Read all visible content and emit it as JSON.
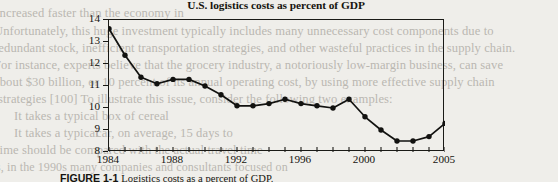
{
  "figure": {
    "caption_label": "FIGURE 1-1",
    "caption_text": "Logistics costs as a percent of GDP."
  },
  "chart_data": {
    "type": "line",
    "title": "U.S. logistics costs as percent of GDP",
    "xlabel": "",
    "ylabel": "",
    "xlim": [
      1984,
      2005
    ],
    "ylim": [
      8,
      14
    ],
    "yticks": [
      8,
      9,
      10,
      11,
      12,
      13,
      14
    ],
    "xticks": [
      1984,
      1985,
      1986,
      1987,
      1988,
      1989,
      1990,
      1991,
      1992,
      1993,
      1994,
      1995,
      1996,
      1997,
      1998,
      1999,
      2000,
      2001,
      2002,
      2003,
      2004,
      2005
    ],
    "xtick_labels": [
      1984,
      1988,
      1992,
      1996,
      2000,
      2005
    ],
    "grid": false,
    "legend": false,
    "marker": "filled-circle",
    "x": [
      1984,
      1985,
      1986,
      1987,
      1988,
      1989,
      1990,
      1991,
      1992,
      1993,
      1994,
      1995,
      1996,
      1997,
      1998,
      1999,
      2000,
      2001,
      2002,
      2003,
      2004,
      2005
    ],
    "values": [
      13.6,
      12.4,
      11.4,
      11.1,
      11.3,
      11.3,
      11.0,
      10.6,
      10.1,
      10.1,
      10.2,
      10.4,
      10.2,
      10.1,
      10.0,
      10.4,
      9.6,
      9.0,
      8.5,
      8.5,
      8.7,
      9.3
    ],
    "series": [
      {
        "name": "U.S. logistics costs as percent of GDP",
        "values": [
          13.6,
          12.4,
          11.4,
          11.1,
          11.3,
          11.3,
          11.0,
          10.6,
          10.1,
          10.1,
          10.2,
          10.4,
          10.2,
          10.1,
          10.0,
          10.4,
          9.6,
          9.0,
          8.5,
          8.5,
          8.7,
          9.3
        ]
      }
    ],
    "line_color": "#121210",
    "marker_color": "#121210"
  },
  "bleed_text": {
    "lines": [
      "increased faster than the economy in",
      "Unfortunately, this huge investment typically includes many unnecessary cost components due to",
      "redundant stock, inefficient transportation strategies, and other wasteful practices in the supply chain.",
      "For instance, experts believe that the grocery industry, a notoriously low-margin business, can save",
      "about $30 billion, or 10 percent of its annual operating cost, by using more effective supply chain",
      "strategies [100] To illustrate this issue, consider the following two examples:",
      "It takes a typical box of cereal",
      "It takes a typical",
      "car, on average, 15 days to",
      "time should be compared with the actual travel time",
      "us, in the 1990s many companies and consultants focused on"
    ]
  }
}
